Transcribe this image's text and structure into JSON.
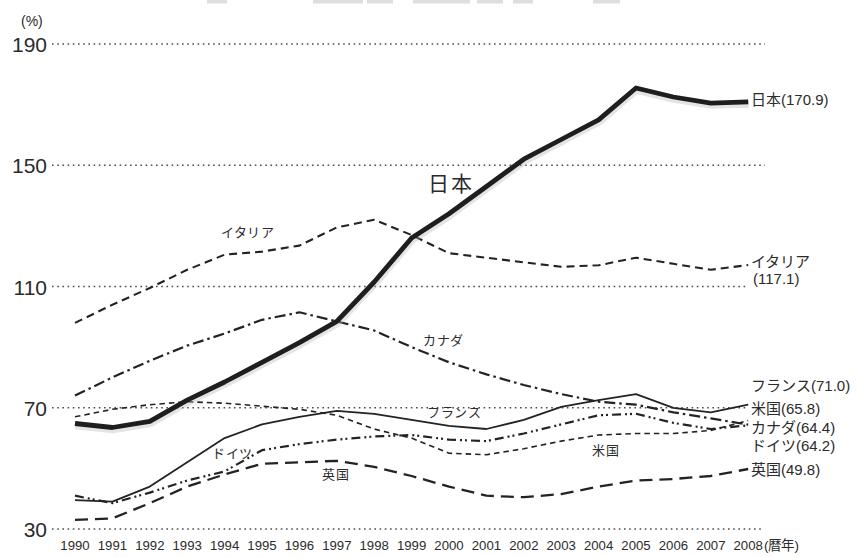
{
  "figure": {
    "unit_label": "(%)",
    "x_axis_suffix": "(暦年)"
  },
  "chart_data": {
    "type": "line",
    "title": "",
    "xlabel": "(暦年)",
    "ylabel": "(%)",
    "ylim": [
      30,
      190
    ],
    "y_ticks": [
      190,
      150,
      110,
      70,
      30
    ],
    "grid": "dotted-horizontal-only",
    "legend_position": "inline-and-right-edge",
    "x": [
      1990,
      1991,
      1992,
      1993,
      1994,
      1995,
      1996,
      1997,
      1998,
      1999,
      2000,
      2001,
      2002,
      2003,
      2004,
      2005,
      2006,
      2007,
      2008
    ],
    "series": [
      {
        "key": "japan",
        "name": "日本",
        "values": [
          64.8,
          63.5,
          65.5,
          72.5,
          78.5,
          85.0,
          91.5,
          98.5,
          111.5,
          126.0,
          134.0,
          143.0,
          152.0,
          158.5,
          165.0,
          175.5,
          172.5,
          170.5,
          170.9
        ],
        "final_value": 170.9,
        "style": {
          "color": "#1e1e1e",
          "width": 4.8,
          "dash": ""
        },
        "inline_label": {
          "text": "日本",
          "x": 428,
          "y": 191,
          "size": 21
        },
        "end_label": {
          "size": 15,
          "lines": [
            {
              "text": "日本(170.9)",
              "x": 751,
              "y": 105
            }
          ]
        }
      },
      {
        "key": "italy",
        "name": "イタリア",
        "values": [
          98.0,
          104.0,
          109.5,
          115.5,
          120.5,
          121.5,
          123.5,
          129.5,
          132.0,
          127.0,
          121.0,
          119.5,
          118.0,
          116.5,
          117.0,
          119.5,
          117.5,
          115.5,
          117.1
        ],
        "final_value": 117.1,
        "style": {
          "color": "#232323",
          "width": 2.1,
          "dash": "8 5"
        },
        "inline_label": {
          "text": "イタリア",
          "x": 221,
          "y": 237,
          "size": 13
        },
        "end_label": {
          "size": 15,
          "lines": [
            {
              "text": "イタリア",
              "x": 751,
              "y": 267
            },
            {
              "text": "(117.1)",
              "x": 753,
              "y": 284
            }
          ]
        }
      },
      {
        "key": "canada",
        "name": "カナダ",
        "values": [
          74.0,
          80.0,
          85.5,
          90.5,
          94.5,
          99.0,
          101.5,
          98.5,
          95.5,
          90.0,
          85.0,
          81.0,
          77.5,
          74.5,
          72.0,
          71.0,
          68.5,
          66.5,
          64.4
        ],
        "final_value": 64.4,
        "style": {
          "color": "#232323",
          "width": 2.2,
          "dash": "11 4 2.5 4"
        },
        "inline_label": {
          "text": "カナダ",
          "x": 423,
          "y": 345,
          "size": 13
        },
        "end_label": {
          "size": 15,
          "lines": [
            {
              "text": "カナダ(64.4)",
              "x": 751,
              "y": 433
            }
          ]
        }
      },
      {
        "key": "france",
        "name": "フランス",
        "values": [
          39.5,
          39.0,
          44.0,
          52.0,
          60.0,
          64.5,
          67.0,
          69.0,
          68.0,
          66.0,
          64.0,
          63.0,
          66.0,
          70.3,
          72.5,
          74.5,
          70.0,
          68.5,
          71.0
        ],
        "final_value": 71.0,
        "style": {
          "color": "#232323",
          "width": 1.8,
          "dash": ""
        },
        "inline_label": {
          "text": "フランス",
          "x": 427,
          "y": 417,
          "size": 13
        },
        "end_label": {
          "size": 15,
          "lines": [
            {
              "text": "フランス(71.0)",
              "x": 751,
              "y": 391
            }
          ]
        }
      },
      {
        "key": "usa",
        "name": "米国",
        "values": [
          67.0,
          69.5,
          71.0,
          72.0,
          71.5,
          70.5,
          69.5,
          67.5,
          63.0,
          60.0,
          55.0,
          54.5,
          56.5,
          59.0,
          61.0,
          61.5,
          61.5,
          62.5,
          65.8
        ],
        "final_value": 65.8,
        "style": {
          "color": "#232323",
          "width": 1.6,
          "dash": "5.5 4"
        },
        "inline_label": {
          "text": "米国",
          "x": 592,
          "y": 455,
          "size": 13
        },
        "end_label": {
          "size": 15,
          "lines": [
            {
              "text": "米国(65.8)",
              "x": 751,
              "y": 414
            }
          ]
        }
      },
      {
        "key": "germany",
        "name": "ドイツ",
        "values": [
          41.0,
          38.5,
          42.0,
          46.0,
          49.0,
          56.0,
          58.0,
          59.5,
          60.5,
          61.0,
          59.5,
          59.0,
          61.5,
          64.5,
          67.5,
          68.0,
          65.0,
          63.0,
          64.2
        ],
        "final_value": 64.2,
        "style": {
          "color": "#232323",
          "width": 2.2,
          "dash": "9 4 2 3 2 4"
        },
        "inline_label": {
          "text": "ドイツ",
          "x": 212,
          "y": 458,
          "size": 13
        },
        "end_label": {
          "size": 15,
          "lines": [
            {
              "text": "ドイツ(64.2)",
              "x": 751,
              "y": 451
            }
          ]
        }
      },
      {
        "key": "uk",
        "name": "英国",
        "values": [
          33.0,
          33.5,
          38.5,
          44.0,
          48.0,
          51.5,
          52.0,
          52.5,
          50.5,
          47.5,
          44.0,
          41.0,
          40.5,
          41.5,
          44.0,
          46.0,
          46.5,
          47.5,
          49.8
        ],
        "final_value": 49.8,
        "style": {
          "color": "#232323",
          "width": 2.3,
          "dash": "13 7"
        },
        "inline_label": {
          "text": "英国",
          "x": 322,
          "y": 479,
          "size": 13
        },
        "end_label": {
          "size": 15,
          "lines": [
            {
              "text": "英国(49.8)",
              "x": 751,
              "y": 475
            }
          ]
        }
      }
    ]
  }
}
